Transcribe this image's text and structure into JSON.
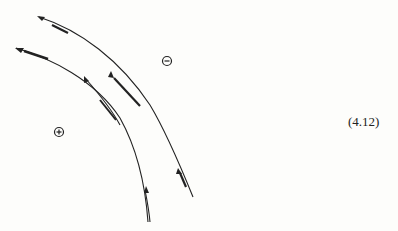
{
  "diagram": {
    "equation_label": "(4.12)",
    "regions": [
      {
        "id": "negative",
        "symbol": "minus",
        "x": 167,
        "y": 61
      },
      {
        "id": "positive",
        "symbol": "plus",
        "x": 59,
        "y": 132
      }
    ],
    "curves": [
      {
        "id": "outer-curve",
        "description": "outer curve with arrows along it"
      },
      {
        "id": "inner-curve",
        "description": "inner curve with arrows along it"
      }
    ],
    "colors": {
      "ink": "#222222",
      "background": "#fdfdfb"
    }
  }
}
